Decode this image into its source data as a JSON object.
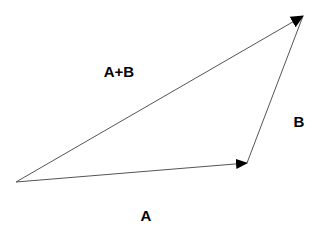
{
  "diagram": {
    "type": "vector-addition-triangle",
    "colors": {
      "line": "#555555",
      "arrowhead": "#000000",
      "text": "#000000",
      "background": "#ffffff"
    },
    "points": {
      "origin": [
        16,
        182
      ],
      "a_end": [
        247,
        163
      ],
      "b_end": [
        303,
        16
      ]
    },
    "vectors": [
      {
        "id": "A",
        "from": "origin",
        "to": "a_end"
      },
      {
        "id": "B",
        "from": "a_end",
        "to": "b_end"
      },
      {
        "id": "A+B",
        "from": "origin",
        "to": "b_end"
      }
    ],
    "labels": {
      "sum": {
        "text": "A+B",
        "x": 119,
        "y": 71
      },
      "b": {
        "text": "B",
        "x": 299,
        "y": 121
      },
      "a": {
        "text": "A",
        "x": 146,
        "y": 215
      }
    }
  }
}
